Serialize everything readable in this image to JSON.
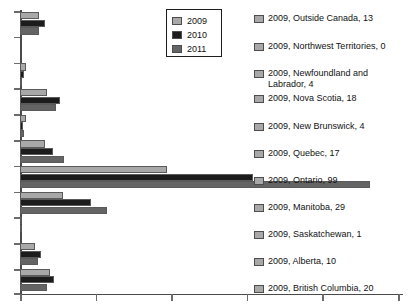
{
  "chart_data": {
    "type": "bar",
    "orientation": "horizontal",
    "title": "",
    "xlabel": "",
    "ylabel": "",
    "grid": false,
    "legend_position": "top-center",
    "xlim": [
      0,
      255
    ],
    "x_ticks": [
      0,
      50,
      100,
      150,
      200,
      250
    ],
    "x_tick_labels": [
      "",
      "",
      "",
      "",
      "",
      ""
    ],
    "series": [
      {
        "name": "2009",
        "color": "#a8a8a8",
        "values": [
          13,
          0,
          4,
          18,
          4,
          17,
          99,
          29,
          1,
          10,
          20
        ]
      },
      {
        "name": "2010",
        "color": "#1c1c1c",
        "values": [
          17,
          0,
          3,
          27,
          2,
          22,
          157,
          48,
          1,
          14,
          23
        ]
      },
      {
        "name": "2011",
        "color": "#646464",
        "values": [
          13,
          0,
          1,
          24,
          3,
          30,
          236,
          59,
          0,
          12,
          18
        ]
      }
    ],
    "categories": [
      "Outside Canada",
      "Northwest Territories",
      "Newfoundland and Labrador",
      "Nova Scotia",
      "New Brunswick",
      "Quebec",
      "Ontario",
      "Manitoba",
      "Saskatchewan",
      "Alberta",
      "British Columbia"
    ]
  },
  "legend": {
    "name": "year-legend",
    "entries": [
      {
        "label": "2009",
        "swatch": "#a8a8a8"
      },
      {
        "label": "2010",
        "swatch": "#1c1c1c"
      },
      {
        "label": "2011",
        "swatch": "#646464"
      }
    ]
  },
  "labels_column": {
    "items": [
      {
        "text": "2009, Outside Canada, 13",
        "top": 13,
        "wrap": false
      },
      {
        "text": "2009, Northwest Territories, 0",
        "top": 41,
        "wrap": false
      },
      {
        "text": "2009, Newfoundland and\n        Labrador, 4",
        "top": 68,
        "wrap": true
      },
      {
        "text": "2009, Nova Scotia, 18",
        "top": 93,
        "wrap": false
      },
      {
        "text": "2009, New Brunswick, 4",
        "top": 121,
        "wrap": false
      },
      {
        "text": "2009, Quebec, 17",
        "top": 148,
        "wrap": false
      },
      {
        "text": "2009, Ontario, 99",
        "top": 175,
        "wrap": false
      },
      {
        "text": "2009, Manitoba, 29",
        "top": 202,
        "wrap": false
      },
      {
        "text": "2009, Saskatchewan, 1",
        "top": 229,
        "wrap": false
      },
      {
        "text": "2009, Alberta, 10",
        "top": 256,
        "wrap": false
      },
      {
        "text": "2009, British Columbia, 20",
        "top": 283,
        "wrap": false
      }
    ]
  },
  "axes": {
    "y_axis_name": "category-axis",
    "x_axis_name": "value-axis",
    "x_tick_positions_px": [
      20,
      95.6,
      171.2,
      246.8,
      322.4,
      398
    ],
    "y_tick_positions_px": [
      11,
      36.8,
      62.6,
      88.4,
      114.2,
      140,
      165.8,
      191.6,
      217.4,
      243.2,
      269,
      293
    ]
  }
}
